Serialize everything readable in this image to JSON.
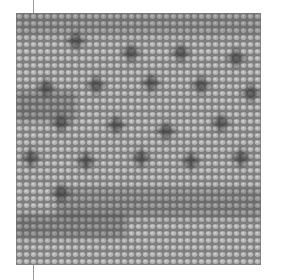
{
  "image": {
    "subject": "grayscale needlepoint stitch texture with dark star motifs",
    "colors": {
      "base": "#8a8a8a",
      "stitch_light": "#b8b8b8",
      "stitch_mid": "#9c9c9c",
      "motif_dark": "#2a2a2a",
      "line": "#9a9a9a"
    },
    "motifs": [
      {
        "x": 60,
        "y": 28
      },
      {
        "x": 115,
        "y": 40
      },
      {
        "x": 165,
        "y": 40
      },
      {
        "x": 220,
        "y": 45
      },
      {
        "x": 30,
        "y": 75
      },
      {
        "x": 80,
        "y": 72
      },
      {
        "x": 135,
        "y": 70
      },
      {
        "x": 185,
        "y": 72
      },
      {
        "x": 235,
        "y": 80
      },
      {
        "x": 45,
        "y": 110
      },
      {
        "x": 100,
        "y": 112
      },
      {
        "x": 150,
        "y": 118
      },
      {
        "x": 205,
        "y": 110
      },
      {
        "x": 15,
        "y": 145
      },
      {
        "x": 70,
        "y": 148
      },
      {
        "x": 125,
        "y": 145
      },
      {
        "x": 175,
        "y": 148
      },
      {
        "x": 225,
        "y": 145
      },
      {
        "x": 45,
        "y": 180
      }
    ],
    "dark_bands": [
      {
        "x": 0,
        "y": 0,
        "w": 245,
        "h": 22,
        "o": 0.25
      },
      {
        "x": 0,
        "y": 78,
        "w": 60,
        "h": 30,
        "o": 0.35
      },
      {
        "x": 40,
        "y": 175,
        "w": 205,
        "h": 30,
        "o": 0.3
      },
      {
        "x": 0,
        "y": 200,
        "w": 110,
        "h": 25,
        "o": 0.35
      }
    ]
  }
}
